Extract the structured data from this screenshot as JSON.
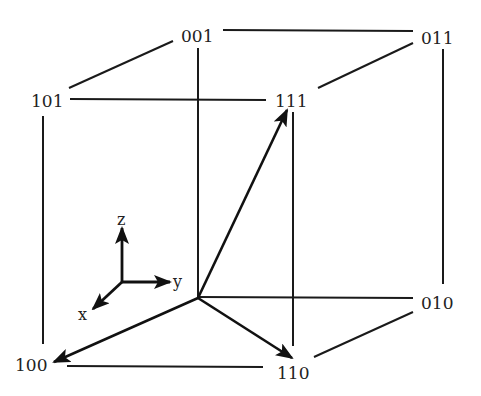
{
  "diagram": {
    "type": "boolean-cube",
    "vertices": [
      {
        "id": "v001",
        "label": "001",
        "x": 197,
        "y": 36
      },
      {
        "id": "v011",
        "label": "011",
        "x": 437,
        "y": 38
      },
      {
        "id": "v101",
        "label": "101",
        "x": 47,
        "y": 101
      },
      {
        "id": "v111",
        "label": "111",
        "x": 290,
        "y": 101
      },
      {
        "id": "v010",
        "label": "010",
        "x": 437,
        "y": 303
      },
      {
        "id": "v100",
        "label": "100",
        "x": 31,
        "y": 365
      },
      {
        "id": "v110",
        "label": "110",
        "x": 292,
        "y": 373
      }
    ],
    "origin": {
      "x": 197,
      "y": 298,
      "label": "000 (unlabeled)"
    },
    "edges": [
      {
        "from": "101",
        "to": "001"
      },
      {
        "from": "001",
        "to": "011"
      },
      {
        "from": "101",
        "to": "111"
      },
      {
        "from": "111",
        "to": "011"
      },
      {
        "from": "101",
        "to": "100"
      },
      {
        "from": "001",
        "to": "000"
      },
      {
        "from": "111",
        "to": "110"
      },
      {
        "from": "011",
        "to": "010"
      },
      {
        "from": "000",
        "to": "010"
      },
      {
        "from": "100",
        "to": "110"
      },
      {
        "from": "110",
        "to": "010"
      }
    ],
    "vectors": [
      {
        "from": "000",
        "to": "111"
      },
      {
        "from": "000",
        "to": "100"
      },
      {
        "from": "000",
        "to": "110"
      }
    ],
    "axes": {
      "z_label": "z",
      "y_label": "y",
      "x_label": "x"
    },
    "colors": {
      "line": "#1a1a1a",
      "text": "#222222",
      "background": "#ffffff"
    }
  }
}
